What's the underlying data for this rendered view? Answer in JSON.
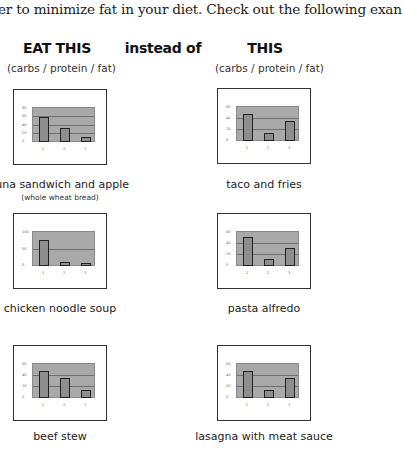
{
  "intro_text": "er to minimize fat in your diet. Check out the following exan",
  "columns": {
    "left": {
      "title": "EAT THIS",
      "subtitle": "(carbs / protein / fat)"
    },
    "middle": {
      "title": "instead of"
    },
    "right": {
      "title": "THIS",
      "subtitle": "(carbs / protein / fat)"
    }
  },
  "colors": {
    "plot_bg": "#a9a9a9",
    "bar": "#8e8e8e",
    "bar_outline": "#222222",
    "frame": "#333333"
  },
  "chart_data": [
    {
      "type": "bar",
      "title": "tuna sandwich and apple",
      "subtitle": "(whole wheat bread)",
      "categories": [
        "1",
        "2",
        "3"
      ],
      "series": [
        {
          "name": "carbs / protein / fat",
          "values": [
            60,
            35,
            12
          ]
        }
      ],
      "yticks": [
        "0",
        "20",
        "40",
        "60",
        "80"
      ],
      "ylim": [
        0,
        80
      ],
      "grid": true
    },
    {
      "type": "bar",
      "title": "taco and fries",
      "categories": [
        "1",
        "2",
        "3"
      ],
      "series": [
        {
          "name": "carbs / protein / fat",
          "values": [
            50,
            15,
            37
          ]
        }
      ],
      "yticks": [
        "0",
        "20",
        "40",
        "60"
      ],
      "ylim": [
        0,
        60
      ],
      "grid": true
    },
    {
      "type": "bar",
      "title": "chicken noodle soup",
      "categories": [
        "1",
        "2",
        "3"
      ],
      "series": [
        {
          "name": "carbs / protein / fat",
          "values": [
            80,
            12,
            9
          ]
        }
      ],
      "yticks": [
        "0",
        "50",
        "100"
      ],
      "ylim": [
        0,
        100
      ],
      "grid": true
    },
    {
      "type": "bar",
      "title": "pasta alfredo",
      "categories": [
        "1",
        "2",
        "3"
      ],
      "series": [
        {
          "name": "carbs / protein / fat",
          "values": [
            53,
            12,
            32
          ]
        }
      ],
      "yticks": [
        "0",
        "20",
        "40",
        "60"
      ],
      "ylim": [
        0,
        60
      ],
      "grid": true
    },
    {
      "type": "bar",
      "title": "beef stew",
      "categories": [
        "1",
        "2",
        "3"
      ],
      "series": [
        {
          "name": "carbs / protein / fat",
          "values": [
            50,
            37,
            15
          ]
        }
      ],
      "yticks": [
        "0",
        "20",
        "40",
        "60"
      ],
      "ylim": [
        0,
        60
      ],
      "grid": true
    },
    {
      "type": "bar",
      "title": "lasagna with meat sauce",
      "categories": [
        "1",
        "2",
        "3"
      ],
      "series": [
        {
          "name": "carbs / protein / fat",
          "values": [
            50,
            15,
            37
          ]
        }
      ],
      "yticks": [
        "0",
        "20",
        "40",
        "60"
      ],
      "ylim": [
        0,
        60
      ],
      "grid": true
    }
  ]
}
